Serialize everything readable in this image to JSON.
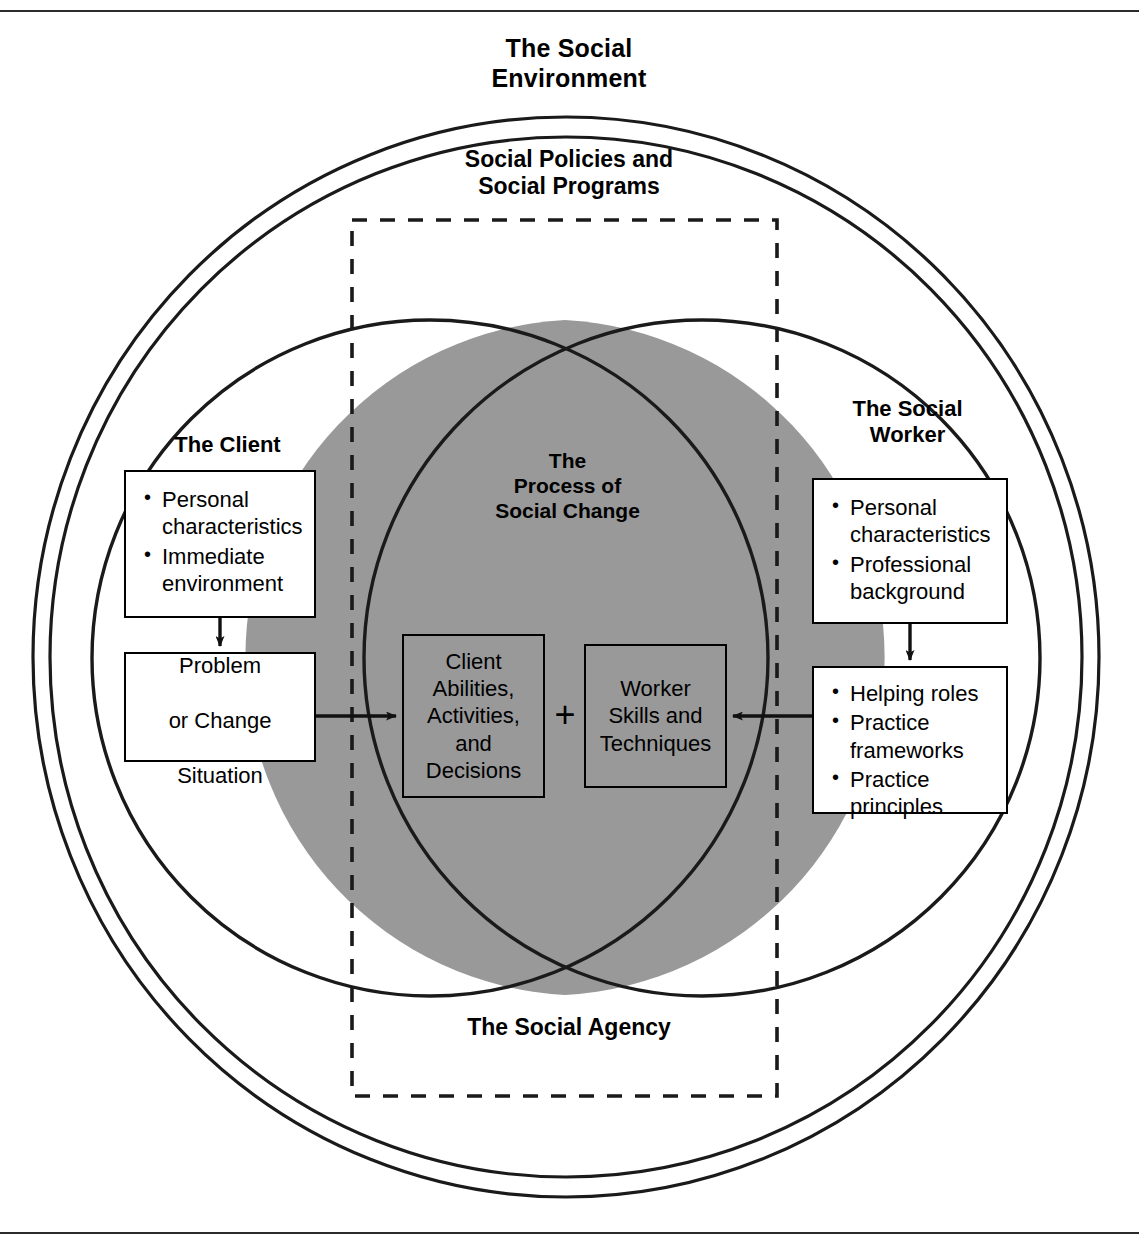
{
  "figure": {
    "outer_label": "The Social\nEnvironment",
    "second_label": "Social Policies and\nSocial Programs",
    "bottom_label": "The Social Agency",
    "center_label": "The\nProcess of\nSocial Change",
    "client_label": "The Client",
    "worker_label": "The Social\nWorker",
    "plus": "+"
  },
  "colors": {
    "lens_fill": "#999999",
    "stroke": "#1a1a1a",
    "box_fill": "#ffffff",
    "page_bg": "#ffffff",
    "rule": "#2b2b2b"
  },
  "boxes": {
    "client_attributes": {
      "items": [
        "Personal characteristics",
        "Immediate environment"
      ]
    },
    "problem": {
      "lines": [
        "Problem",
        "or Change",
        "Situation"
      ]
    },
    "worker_attributes": {
      "items": [
        "Personal characteristics",
        "Professional background"
      ]
    },
    "worker_practice": {
      "items": [
        "Helping roles",
        "Practice frameworks",
        "Practice principles"
      ]
    },
    "client_abilities": {
      "lines": [
        "Client",
        "Abilities,",
        "Activities,",
        "and",
        "Decisions"
      ]
    },
    "worker_skills": {
      "lines": [
        "Worker",
        "Skills and",
        "Techniques"
      ]
    }
  }
}
